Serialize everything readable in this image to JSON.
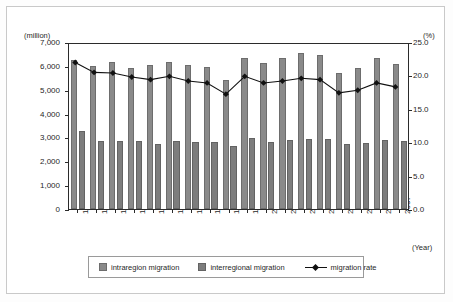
{
  "chart_data": {
    "type": "bar",
    "title": "",
    "xlabel": "(Year)",
    "ylabel": "(million)",
    "y2label": "(%)",
    "ylim": [
      0,
      7000
    ],
    "y2lim": [
      0,
      25
    ],
    "grid": false,
    "legend_position": "bottom",
    "categories": [
      "1990",
      "1991",
      "1992",
      "1993",
      "1994",
      "1995",
      "1996",
      "1997",
      "1998",
      "1999",
      "2000",
      "2001",
      "2002",
      "2003",
      "2004",
      "2005",
      "2006",
      "2007"
    ],
    "y_ticks": [
      "0",
      "1,000",
      "2,000",
      "3,000",
      "4,000",
      "5,000",
      "6,000",
      "7,000"
    ],
    "y2_ticks": [
      "0.0",
      "5.0",
      "10.0",
      "15.0",
      "20.0",
      "25.0"
    ],
    "series": [
      {
        "name": "intraregion migration",
        "axis": "left",
        "type": "bar",
        "color": "#8a8a8a",
        "values": [
          6230,
          6000,
          6170,
          5920,
          6020,
          6180,
          6020,
          5950,
          5410,
          6350,
          6120,
          6320,
          6520,
          6450,
          5720,
          5920,
          6320,
          6080
        ]
      },
      {
        "name": "interregional migration",
        "axis": "left",
        "type": "bar",
        "color": "#7d7d7d",
        "values": [
          3250,
          2870,
          2860,
          2850,
          2720,
          2850,
          2800,
          2790,
          2660,
          2990,
          2790,
          2880,
          2930,
          2920,
          2720,
          2770,
          2880,
          2860
        ]
      },
      {
        "name": "migration rate",
        "axis": "right",
        "type": "line",
        "color": "#111111",
        "marker": "diamond",
        "values": [
          22.2,
          20.7,
          20.6,
          20.0,
          19.6,
          20.1,
          19.4,
          19.1,
          17.4,
          20.1,
          19.1,
          19.4,
          19.8,
          19.6,
          17.6,
          18.0,
          19.1,
          18.5
        ]
      }
    ]
  },
  "legend": {
    "items": [
      {
        "label": "intraregion migration",
        "icon": "square-swatch"
      },
      {
        "label": "interregional migration",
        "icon": "square-swatch"
      },
      {
        "label": "migration rate",
        "icon": "line-diamond-swatch"
      }
    ]
  }
}
